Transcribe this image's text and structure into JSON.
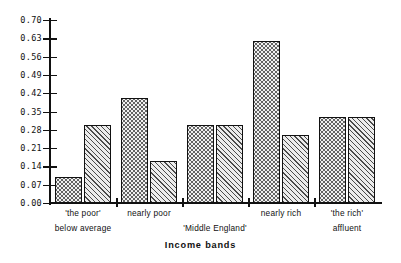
{
  "chart_data": {
    "type": "bar",
    "title": "",
    "xlabel": "Income bands",
    "ylabel": "",
    "ylim": [
      0.0,
      0.7
    ],
    "grid": false,
    "legend": "none",
    "ytick_labels": [
      "0.70",
      "0.63",
      "0.56",
      "0.49",
      "0.42",
      "0.35",
      "0.28",
      "0.21",
      "0.14",
      "0.07",
      "0.00"
    ],
    "ytick_values": [
      0.7,
      0.63,
      0.56,
      0.49,
      0.42,
      0.35,
      0.28,
      0.21,
      0.14,
      0.07,
      0.0
    ],
    "categories": [
      "'the poor'\nbelow average",
      "nearly poor",
      "'Middle England'",
      "nearly rich",
      "'the rich'\naffluent"
    ],
    "group_labels_row1": [
      "'the  poor'",
      "nearly  poor",
      "",
      "nearly  rich",
      "'the  rich'"
    ],
    "group_labels_row2": [
      "below average",
      "",
      "'Middle England'",
      "",
      "affluent"
    ],
    "series": [
      {
        "name": "series-dotted",
        "pattern": "dots",
        "values": [
          0.1,
          0.4,
          0.3,
          0.62,
          0.33
        ]
      },
      {
        "name": "series-hatched",
        "pattern": "diagonal-hatch",
        "values": [
          0.3,
          0.16,
          0.3,
          0.26,
          0.33
        ]
      }
    ]
  },
  "axis": {
    "x_title": "Income bands"
  }
}
